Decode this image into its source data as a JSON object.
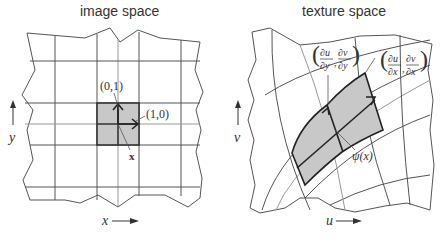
{
  "panels": {
    "left": {
      "title": "image space",
      "axis_x": "x",
      "axis_y": "y",
      "label_e2": "(0,1)",
      "label_e1": "(1,0)",
      "label_point": "x"
    },
    "right": {
      "title": "texture space",
      "axis_x": "u",
      "axis_y": "v",
      "label_dy_num_u": "∂u",
      "label_dy_den_u": "∂y",
      "label_dy_num_v": "∂v",
      "label_dy_den_v": "∂y",
      "label_dx_num_u": "∂u",
      "label_dx_den_u": "∂x",
      "label_dx_num_v": "∂v",
      "label_dx_den_v": "∂x",
      "label_point": "ψ(x)"
    }
  },
  "colors": {
    "grid": "#555555",
    "grid_light": "#999999",
    "shade": "#c8c8c8",
    "ink": "#222222"
  }
}
